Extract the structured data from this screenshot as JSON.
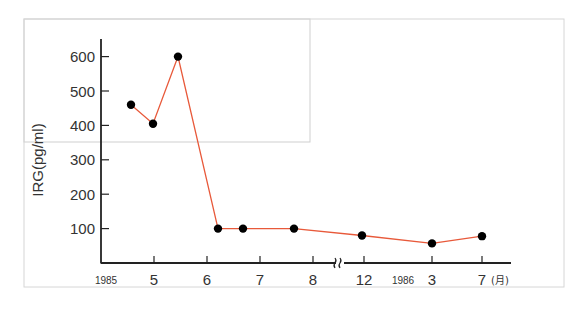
{
  "chart_data": {
    "type": "line",
    "title": "",
    "xlabel": "",
    "ylabel": "IRG (pg/ml)",
    "ylim": [
      0,
      650
    ],
    "y_ticks": [
      100,
      200,
      300,
      400,
      500,
      600
    ],
    "y_tick_labels": [
      "100",
      "200",
      "300",
      "400",
      "500",
      "600"
    ],
    "x_tick_labels": [
      "5",
      "6",
      "7",
      "8",
      "12",
      "3",
      "7"
    ],
    "x_year_labels": [
      "1985",
      "1986"
    ],
    "x_unit_label": "(月)",
    "axis_break_symbol": "≈",
    "grid": false,
    "legend": null,
    "series": [
      {
        "name": "IRG",
        "color": "#e8593a",
        "marker_color": "#000000",
        "x": [
          "1985-4 late",
          "1985-5",
          "1985-5 mid",
          "1985-6 early",
          "1985-6 mid",
          "1985-7 mid",
          "1985-12",
          "1986-3",
          "1986-7"
        ],
        "values": [
          460,
          405,
          600,
          100,
          100,
          100,
          80,
          57,
          78
        ]
      }
    ]
  }
}
